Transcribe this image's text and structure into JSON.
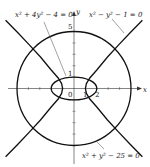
{
  "diagram": {
    "axes": {
      "x_label": "x",
      "y_label": "y"
    },
    "tick_labels": {
      "origin": "0",
      "x_one": "1",
      "x_two": "2",
      "y_one": "1",
      "y_five": "5"
    },
    "equations": {
      "ellipse": "x² + 4y² − 4 = 0",
      "hyperbola": "x² − y² − 1 = 0",
      "circle": "x² + y² − 25 = 0"
    },
    "colors": {
      "curve": "#111111",
      "axis": "#333333",
      "background": "#ffffff"
    }
  }
}
